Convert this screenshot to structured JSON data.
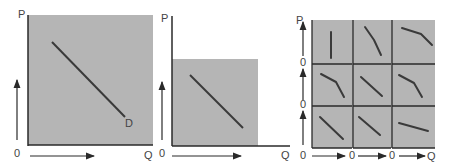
{
  "colors": {
    "panel_fill": "#b5b5b5",
    "axis": "#2a2a2a",
    "curve": "#3a3a3a",
    "label": "#444444"
  },
  "panel1": {
    "y_axis_label": "P",
    "x_axis_label": "Q",
    "origin_label": "0",
    "curve_label": "D",
    "curve": [
      [
        52,
        42
      ],
      [
        125,
        117
      ]
    ]
  },
  "panel2": {
    "y_axis_label": "P",
    "x_axis_label": "Q",
    "origin_label": "0",
    "curve": [
      [
        190,
        75
      ],
      [
        243,
        128
      ]
    ]
  },
  "panel3": {
    "y_axis_label": "P",
    "x_axis_label": "Q",
    "row_origin_labels": [
      "0",
      "0",
      "0"
    ],
    "col_origin_labels": [
      "0",
      "0"
    ],
    "cells": [
      {
        "row": 0,
        "col": 0,
        "shape": "vertical"
      },
      {
        "row": 0,
        "col": 1,
        "shape": "steep-concave"
      },
      {
        "row": 0,
        "col": 2,
        "shape": "flat-then-steep"
      },
      {
        "row": 1,
        "col": 0,
        "shape": "kinked"
      },
      {
        "row": 1,
        "col": 1,
        "shape": "linear"
      },
      {
        "row": 1,
        "col": 2,
        "shape": "kinked"
      },
      {
        "row": 2,
        "col": 0,
        "shape": "linear"
      },
      {
        "row": 2,
        "col": 1,
        "shape": "linear"
      },
      {
        "row": 2,
        "col": 2,
        "shape": "flat"
      }
    ]
  }
}
